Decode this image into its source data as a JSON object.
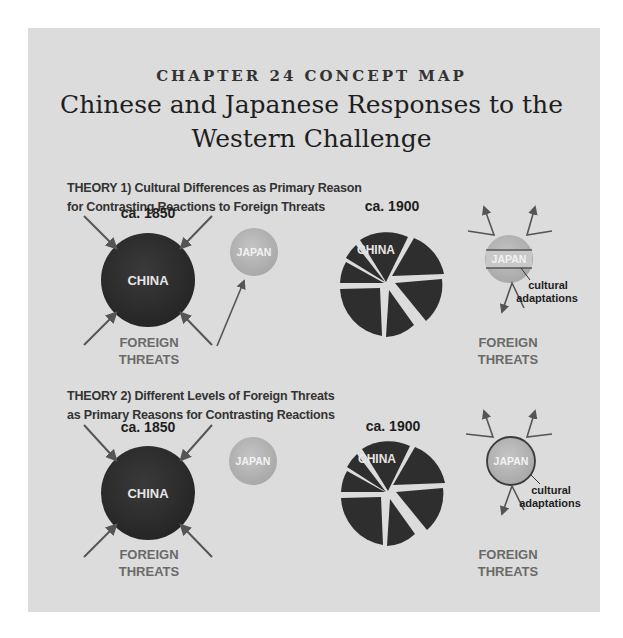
{
  "header": {
    "kicker": "CHAPTER 24 CONCEPT MAP",
    "title_line1": "Chinese and Japanese Responses to the",
    "title_line2": "Western Challenge"
  },
  "theory1": {
    "heading_line1": "THEORY 1) Cultural Differences as Primary Reason",
    "heading_line2": "for Contrasting Reactions to Foreign Threats",
    "left": {
      "date": "ca. 1850",
      "china": "CHINA",
      "japan": "JAPAN",
      "threats_line1": "FOREIGN",
      "threats_line2": "THREATS"
    },
    "right": {
      "date": "ca. 1900",
      "china": "CHINA",
      "japan": "JAPAN",
      "adapt_line1": "cultural",
      "adapt_line2": "adaptations",
      "threats_line1": "FOREIGN",
      "threats_line2": "THREATS"
    }
  },
  "theory2": {
    "heading_line1": "THEORY 2) Different Levels of Foreign Threats",
    "heading_line2": "as Primary Reasons for Contrasting Reactions",
    "left": {
      "date": "ca. 1850",
      "china": "CHINA",
      "japan": "JAPAN",
      "threats_line1": "FOREIGN",
      "threats_line2": "THREATS"
    },
    "right": {
      "date": "ca. 1900",
      "china": "CHINA",
      "japan": "JAPAN",
      "adapt_line1": "cultural",
      "adapt_line2": "adaptations",
      "threats_line1": "FOREIGN",
      "threats_line2": "THREATS"
    }
  },
  "colors": {
    "panel": "#dcdcdc",
    "china": "#2e2e2e",
    "japan": "#b5b5b5",
    "arrow": "#555555",
    "threats_text": "#6a6a6a"
  }
}
